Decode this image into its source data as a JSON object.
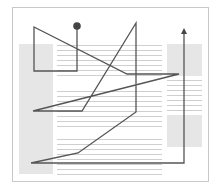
{
  "diagram": {
    "type": "reading-path-over-page-layout",
    "colors": {
      "background": "#ffffff",
      "frame": "#c8c8c8",
      "block": "#e6e6e6",
      "text_line": "#cfcfcf",
      "path": "#555555",
      "marker": "#444444"
    },
    "frame": {
      "x": 12,
      "y": 7,
      "w": 196,
      "h": 174
    },
    "blocks": [
      {
        "name": "left-sidebar-block",
        "x": 19,
        "y": 44,
        "w": 34,
        "h": 130
      },
      {
        "name": "right-top-block",
        "x": 167,
        "y": 44,
        "w": 35,
        "h": 32
      },
      {
        "name": "right-bottom-block",
        "x": 167,
        "y": 115,
        "w": 35,
        "h": 32
      }
    ],
    "text_line_groups": [
      {
        "name": "main-text-group-1",
        "x1": 57,
        "x2": 162,
        "y_start": 45,
        "count": 7,
        "spacing": 5
      },
      {
        "name": "main-text-group-2",
        "x1": 57,
        "x2": 162,
        "y_start": 91,
        "count": 8,
        "spacing": 5
      },
      {
        "name": "main-text-group-3",
        "x1": 57,
        "x2": 162,
        "y_start": 139,
        "count": 8,
        "spacing": 5
      },
      {
        "name": "right-text-group",
        "x1": 167,
        "x2": 202,
        "y_start": 80,
        "count": 7,
        "spacing": 5
      }
    ],
    "path": {
      "start_marker": "filled-circle",
      "end_marker": "arrowhead-up",
      "points": [
        [
          77,
          27
        ],
        [
          77,
          71
        ],
        [
          34,
          71
        ],
        [
          34,
          27
        ],
        [
          127,
          74
        ],
        [
          179,
          74
        ],
        [
          33,
          111
        ],
        [
          82,
          111
        ],
        [
          136,
          23
        ],
        [
          136,
          112
        ],
        [
          78,
          153
        ],
        [
          31,
          163
        ],
        [
          184,
          163
        ],
        [
          184,
          32
        ]
      ]
    }
  }
}
